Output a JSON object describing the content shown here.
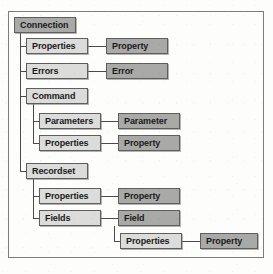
{
  "diagram": {
    "colors": {
      "frame_border": "#7c7c7c",
      "node_border": "#5e5e5e",
      "collection_fill": "#dcdcda",
      "object_fill": "#a9a9a7",
      "connector": "#4a4a4a",
      "background": "#fdfdfc",
      "text": "#1a1a1a"
    },
    "nodes": {
      "connection": "Connection",
      "conn_properties": "Properties",
      "conn_property": "Property",
      "errors": "Errors",
      "error": "Error",
      "command": "Command",
      "parameters": "Parameters",
      "parameter": "Parameter",
      "cmd_properties": "Properties",
      "cmd_property": "Property",
      "recordset": "Recordset",
      "rs_properties": "Properties",
      "rs_property": "Property",
      "fields": "Fields",
      "field": "Field",
      "field_properties": "Properties",
      "field_property": "Property"
    }
  }
}
